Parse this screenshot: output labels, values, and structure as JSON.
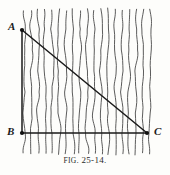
{
  "figure": {
    "caption_prefix": "Fig",
    "caption_number": ". 25-14.",
    "caption_full": "Fig. 25-14.",
    "background_color": "#fdfdfb",
    "ink_color": "#1a1a1a",
    "field_line_color": "#4a4a4a"
  },
  "vertices": {
    "A": {
      "label": "A",
      "x": 22,
      "y": 30
    },
    "B": {
      "label": "B",
      "x": 22,
      "y": 133
    },
    "C": {
      "label": "C",
      "x": 147,
      "y": 133
    }
  },
  "chart_data": {
    "type": "diagram",
    "title": "Fig. 25-14.",
    "shape": "right-triangle",
    "points": [
      {
        "name": "A",
        "x": 22,
        "y": 30
      },
      {
        "name": "B",
        "x": 22,
        "y": 133
      },
      {
        "name": "C",
        "x": 147,
        "y": 133
      }
    ],
    "segments": [
      {
        "name": "AB",
        "from": "A",
        "to": "B",
        "style": "solid",
        "role": "vertical-leg"
      },
      {
        "name": "BC",
        "from": "B",
        "to": "C",
        "style": "solid",
        "role": "horizontal-leg"
      },
      {
        "name": "AC",
        "from": "A",
        "to": "C",
        "style": "solid",
        "role": "hypotenuse"
      }
    ],
    "field": {
      "name": "vertical-field-lines",
      "orientation": "vertical",
      "count": 19,
      "x_start": 24,
      "x_end": 150,
      "spacing": 7,
      "y_top": 8,
      "y_bottom": 155,
      "style": "hand-drawn wavy"
    },
    "grid": false,
    "legend": null,
    "xlabel": "",
    "ylabel": ""
  }
}
